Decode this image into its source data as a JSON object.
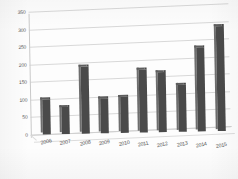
{
  "chart_data": {
    "type": "bar",
    "title": "",
    "subtitle": "",
    "xlabel": "",
    "ylabel": "",
    "categories": [
      "2006",
      "2007",
      "2008",
      "2009",
      "2010",
      "2011",
      "2012",
      "2013",
      "2014",
      "2015"
    ],
    "values": [
      100,
      78,
      190,
      100,
      102,
      178,
      172,
      135,
      240,
      300
    ],
    "series": [
      {
        "name": "",
        "values": [
          100,
          78,
          190,
          100,
          102,
          178,
          172,
          135,
          240,
          300
        ]
      }
    ],
    "ylim": [
      0,
      350
    ],
    "yticks": [
      0,
      50,
      100,
      150,
      200,
      250,
      300,
      350
    ],
    "ytick_labels": [
      "0",
      "50",
      "100",
      "150",
      "200",
      "250",
      "300",
      "350"
    ],
    "grid": true,
    "legend": false,
    "legend_position": "none",
    "annotations": [],
    "style": {
      "bar_color": "#4a4a4a",
      "bar_side_color": "#6e6e6e",
      "bar_top_color": "#5e5e5e",
      "grid_color": "#d8d8d8",
      "axis_color": "#c9c9c9",
      "tick_label_color": "#5c5c5c",
      "background": "#fdfdfd",
      "three_d": true
    }
  }
}
